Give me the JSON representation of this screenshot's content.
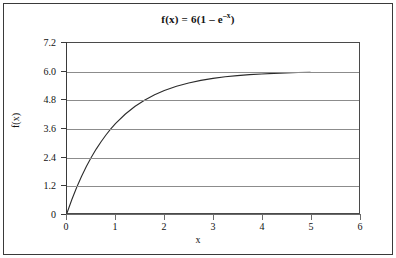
{
  "chart_data": {
    "type": "line",
    "title_parts": {
      "main": "f(x) = 6(1 – e",
      "exponent": "–x",
      "tail": ")"
    },
    "xlabel": "x",
    "ylabel": "f(x)",
    "xlim": [
      0,
      6
    ],
    "ylim": [
      0,
      7.2
    ],
    "xticks": [
      "0",
      "1",
      "2",
      "3",
      "4",
      "5",
      "6"
    ],
    "xtick_values": [
      0,
      1,
      2,
      3,
      4,
      5,
      6
    ],
    "yticks": [
      "0",
      "1.2",
      "2.4",
      "3.6",
      "4.8",
      "6.0",
      "7.2"
    ],
    "ytick_values": [
      0,
      1.2,
      2.4,
      3.6,
      4.8,
      6.0,
      7.2
    ],
    "grid": "horizontal",
    "legend": "none",
    "series": [
      {
        "name": "f(x) = 6(1 - e^-x)",
        "color": "#2b2b2b",
        "x": [
          0,
          0.1,
          0.2,
          0.3,
          0.4,
          0.5,
          0.6,
          0.7,
          0.8,
          0.9,
          1.0,
          1.2,
          1.4,
          1.6,
          1.8,
          2.0,
          2.25,
          2.5,
          2.75,
          3.0,
          3.25,
          3.5,
          3.75,
          4.0,
          4.25,
          4.5,
          4.75,
          5.0
        ],
        "values": [
          0.0,
          0.571,
          1.088,
          1.555,
          1.978,
          2.361,
          2.707,
          3.02,
          3.304,
          3.56,
          3.793,
          4.193,
          4.521,
          4.788,
          5.008,
          5.188,
          5.368,
          5.508,
          5.616,
          5.701,
          5.767,
          5.819,
          5.859,
          5.89,
          5.914,
          5.933,
          5.948,
          5.96
        ]
      }
    ]
  },
  "figure": {
    "background_color": "#ffffff",
    "gridline_color": "#8c8c8c",
    "axis_color": "#3a3a3a",
    "frame_color": "#3a3a3a"
  }
}
